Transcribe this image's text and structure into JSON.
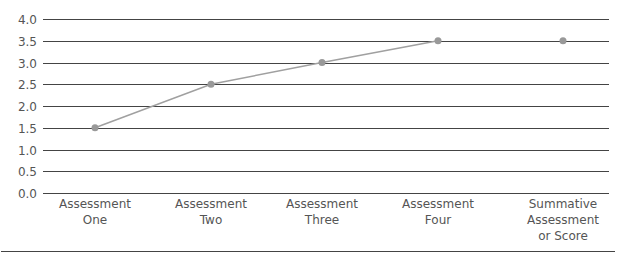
{
  "chart_data": {
    "type": "line",
    "title": "",
    "xlabel": "",
    "ylabel": "",
    "categories": [
      "Assessment One",
      "Assessment Two",
      "Assessment Three",
      "Assessment Four",
      "Summative Assessment or Score"
    ],
    "category_label_lines": [
      [
        "Assessment",
        "One"
      ],
      [
        "Assessment",
        "Two"
      ],
      [
        "Assessment",
        "Three"
      ],
      [
        "Assessment",
        "Four"
      ],
      [
        "Summative",
        "Assessment",
        "or Score"
      ]
    ],
    "series": [
      {
        "name": "Formative assessments",
        "values": [
          1.5,
          2.5,
          3.0,
          3.5,
          null
        ],
        "connected": true
      },
      {
        "name": "Summative",
        "values": [
          null,
          null,
          null,
          null,
          3.5
        ],
        "connected": false
      }
    ],
    "values": [
      1.5,
      2.5,
      3.0,
      3.5,
      3.5
    ],
    "ylim": [
      0.0,
      4.0
    ],
    "yticks": [
      "0.0",
      "0.5",
      "1.0",
      "1.5",
      "2.0",
      "2.5",
      "3.0",
      "3.5",
      "4.0"
    ],
    "grid": true,
    "legend": "none",
    "colors": {
      "line": "#a0a0a0",
      "marker": "#999999",
      "grid": "#444444",
      "text": "#555555"
    }
  }
}
